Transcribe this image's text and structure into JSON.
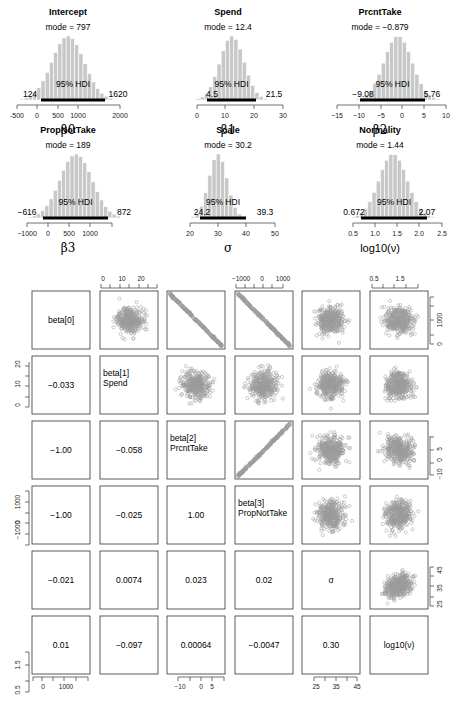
{
  "chart_data": [
    {
      "type": "bar",
      "title": "Intercept",
      "xlabel": "β0",
      "mode_label": "mode = 797",
      "mode": 797,
      "hdi_label": "95% HDI",
      "hdi_low": "124",
      "hdi_high": "1620",
      "xticks": [
        "-500",
        "0",
        "500",
        "1000",
        "2000"
      ],
      "xlim": [
        -500,
        2000
      ]
    },
    {
      "type": "bar",
      "title": "Spend",
      "xlabel": "β1",
      "mode_label": "mode = 12.4",
      "mode": 12.4,
      "hdi_label": "95% HDI",
      "hdi_low": "4.5",
      "hdi_high": "21.5",
      "xticks": [
        "0",
        "10",
        "20",
        "30"
      ],
      "xlim": [
        0,
        30
      ]
    },
    {
      "type": "bar",
      "title": "PrcntTake",
      "xlabel": "β2",
      "mode_label": "mode = −0.879",
      "mode": -0.879,
      "hdi_label": "95% HDI",
      "hdi_low": "−9.08",
      "hdi_high": "5.76",
      "xticks": [
        "−15",
        "−10",
        "−5",
        "0",
        "5",
        "10"
      ],
      "xlim": [
        -15,
        10
      ]
    },
    {
      "type": "bar",
      "title": "PropNotTake",
      "xlabel": "β3",
      "mode_label": "mode = 189",
      "mode": 189,
      "hdi_label": "95% HDI",
      "hdi_low": "−616",
      "hdi_high": "872",
      "xticks": [
        "−1000",
        "0",
        "500",
        "1000"
      ],
      "xlim": [
        -1000,
        1000
      ]
    },
    {
      "type": "bar",
      "title": "Scale",
      "xlabel": "σ",
      "mode_label": "mode = 30.2",
      "mode": 30.2,
      "hdi_label": "95% HDI",
      "hdi_low": "24.2",
      "hdi_high": "39.3",
      "xticks": [
        "20",
        "30",
        "40",
        "50"
      ],
      "xlim": [
        20,
        50
      ]
    },
    {
      "type": "bar",
      "title": "Normality",
      "xlabel": "log10(ν)",
      "mode_label": "mode = 1.44",
      "mode": 1.44,
      "hdi_label": "95% HDI",
      "hdi_low": "0.672",
      "hdi_high": "2.07",
      "xticks": [
        "0.5",
        "1.0",
        "1.5",
        "2.0",
        "2.5"
      ],
      "xlim": [
        0.5,
        2.5
      ]
    },
    {
      "type": "scatter",
      "title": "Pairs plot",
      "variables": [
        "beta[0]",
        "beta[1] Spend",
        "beta[2] PrcntTake",
        "beta[3] PropNotTake",
        "σ",
        "log10(ν)"
      ],
      "diag_labels": [
        [
          "beta[0]"
        ],
        [
          "beta[1]",
          "Spend"
        ],
        [
          "beta[2]",
          "PrcntTake"
        ],
        [
          "beta[3]",
          "PropNotTake"
        ],
        [
          "σ"
        ],
        [
          "log10(ν)"
        ]
      ],
      "correlations": {
        "r1c0": "−0.033",
        "r2c0": "−1.00",
        "r2c1": "−0.058",
        "r3c0": "−1.00",
        "r3c1": "−0.025",
        "r3c2": "1.00",
        "r4c0": "−0.021",
        "r4c1": "0.0074",
        "r4c2": "0.023",
        "r4c3": "0.02",
        "r5c0": "0.01",
        "r5c1": "−0.097",
        "r5c2": "0.00064",
        "r5c3": "−0.0047",
        "r5c4": "0.30"
      },
      "top_axes": {
        "col1": [
          "0",
          "10",
          "20"
        ],
        "col3": [
          "−1000",
          "0",
          "1000"
        ],
        "col5": [
          "0.5",
          "1.5"
        ]
      },
      "bottom_axes": {
        "col0": [
          "0",
          "1000"
        ],
        "col2": [
          "−10",
          "0",
          "5"
        ],
        "col4": [
          "25",
          "35",
          "45"
        ]
      },
      "left_axes": {
        "row1": [
          "0",
          "10",
          "20"
        ],
        "row3": [
          "−1000",
          "0",
          "1000"
        ],
        "row5": [
          "0.5",
          "1.5"
        ]
      },
      "right_axes": {
        "row0": [
          "0",
          "1000"
        ],
        "row2": [
          "−10",
          "0",
          "5"
        ],
        "row4": [
          "25",
          "35",
          "45"
        ]
      }
    }
  ]
}
